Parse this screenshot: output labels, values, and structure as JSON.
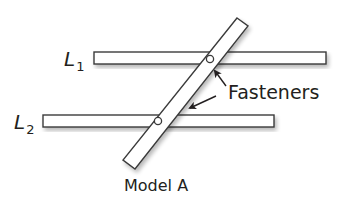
{
  "diagram": {
    "title": "Model A",
    "callout_label": "Fasteners",
    "lines": [
      {
        "id": "L1",
        "label_main": "L",
        "label_sub": "1"
      },
      {
        "id": "L2",
        "label_main": "L",
        "label_sub": "2"
      }
    ],
    "fastener_count": 2,
    "colors": {
      "stroke": "#3a3a3a",
      "fill": "#ffffff",
      "shadow": "#c8c8c8",
      "text": "#231f20"
    }
  }
}
